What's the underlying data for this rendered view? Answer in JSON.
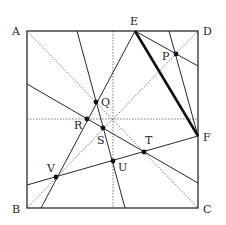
{
  "figure": {
    "colors": {
      "line": "#2a2a2a",
      "dotted": "#555555",
      "point": "#111111",
      "background": "#ffffff"
    },
    "corners": {
      "A": {
        "label": "A",
        "x": 27,
        "y": 31
      },
      "B": {
        "label": "B",
        "x": 27,
        "y": 208
      },
      "C": {
        "label": "C",
        "x": 198,
        "y": 208
      },
      "D": {
        "label": "D",
        "x": 198,
        "y": 31
      }
    },
    "edge_points": {
      "E": {
        "label": "E",
        "x": 135,
        "y": 31
      },
      "F": {
        "label": "F",
        "x": 198,
        "y": 136
      }
    },
    "points": {
      "P": {
        "label": "P",
        "x": 176,
        "y": 54
      },
      "Q": {
        "label": "Q",
        "x": 96,
        "y": 102
      },
      "R": {
        "label": "R",
        "x": 87,
        "y": 119
      },
      "S": {
        "label": "S",
        "x": 103,
        "y": 128
      },
      "T": {
        "label": "T",
        "x": 144,
        "y": 152
      },
      "U": {
        "label": "U",
        "x": 113,
        "y": 161
      },
      "V": {
        "label": "V",
        "x": 56,
        "y": 177
      }
    },
    "labels": [
      "A",
      "B",
      "C",
      "D",
      "E",
      "F",
      "P",
      "Q",
      "R",
      "S",
      "T",
      "U",
      "V"
    ]
  }
}
